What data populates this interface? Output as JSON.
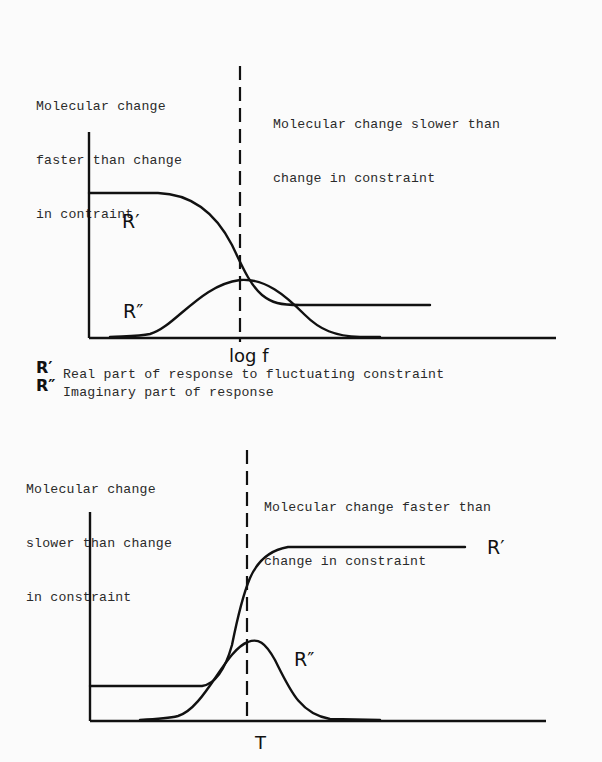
{
  "top_diagram": {
    "left_region_label": [
      "Molecular change",
      "faster than change",
      "in contraint"
    ],
    "right_region_label": [
      "Molecular change slower than",
      "change in constraint"
    ],
    "x_axis_label": "log f",
    "curve_labels": {
      "real": "R′",
      "imaginary": "R″"
    }
  },
  "legend": {
    "items": [
      {
        "symbol": "R′",
        "text": "Real part of response to fluctuating constraint"
      },
      {
        "symbol": "R″",
        "text": "Imaginary part of response"
      }
    ]
  },
  "bottom_diagram": {
    "left_region_label": [
      "Molecular change",
      "slower than change",
      "in constraint"
    ],
    "right_region_label": [
      "Molecular change faster than",
      "change in constraint"
    ],
    "x_axis_label": "T",
    "curve_labels": {
      "real": "R′",
      "imaginary": "R″"
    }
  }
}
